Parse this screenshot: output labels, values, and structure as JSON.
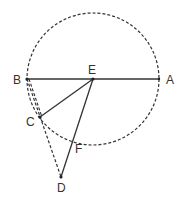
{
  "diagram": {
    "type": "geometry",
    "circle": {
      "cx": 93,
      "cy": 79,
      "r": 66,
      "style": "dashed",
      "color": "#333333"
    },
    "points": [
      {
        "name": "A",
        "x": 159,
        "y": 79,
        "label_x": 166,
        "label_y": 84
      },
      {
        "name": "B",
        "x": 27,
        "y": 79,
        "label_x": 13,
        "label_y": 84
      },
      {
        "name": "C",
        "x": 40,
        "y": 117,
        "label_x": 26,
        "label_y": 126
      },
      {
        "name": "D",
        "x": 61,
        "y": 177,
        "label_x": 57,
        "label_y": 192
      },
      {
        "name": "E",
        "x": 93,
        "y": 79,
        "label_x": 88,
        "label_y": 74
      },
      {
        "name": "F",
        "x": 73,
        "y": 140,
        "label_x": 75,
        "label_y": 153
      }
    ],
    "segments": [
      {
        "from": "B",
        "to": "A",
        "style": "solid"
      },
      {
        "from": "E",
        "to": "C",
        "style": "solid"
      },
      {
        "from": "E",
        "to": "D",
        "style": "solid"
      },
      {
        "from": "B",
        "to": "D",
        "style": "dashed"
      },
      {
        "from": "C",
        "to": "D",
        "style": "dashed"
      }
    ],
    "labels": {
      "A": "A",
      "B": "B",
      "C": "C",
      "D": "D",
      "E": "E",
      "F": "F"
    },
    "line_color": "#333333"
  }
}
